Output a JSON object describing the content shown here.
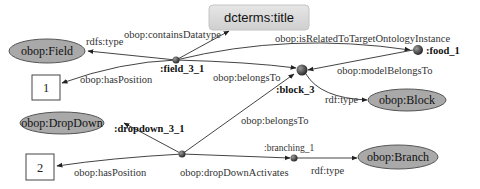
{
  "diagram": {
    "colors": {
      "class_fill": "#a9a9a9",
      "class_stroke": "#555555",
      "property_box_fill": "#d9d9d9",
      "instance_node": "#3a3a3a",
      "edge": "#444444"
    },
    "nodes": {
      "dcterms_title": "dcterms:title",
      "obop_field": "obop:Field",
      "obop_dropdown": "obop:DropDown",
      "obop_block": "obop:Block",
      "obop_branch": "obop:Branch",
      "literal_1": "1",
      "literal_2": "2",
      "field_3_1": ":field_3_1",
      "block_3": ":block_3",
      "food_1": ":food_1",
      "dropdown_3_1": ":dropdown_3_1",
      "branching_1": ":branching_1"
    },
    "edges": {
      "field_rdfs_type": "rdfs:type",
      "field_contains_datatype": "obop:containsDatatype",
      "field_has_position": "obop:hasPosition",
      "field_is_related": "obop:isRelatedToTargetOntologyInstance",
      "field_belongs_to": "obop:belongsTo",
      "food_model_belongs_to": "obop:modelBelongsTo",
      "block_rdf_type": "rdf:type",
      "dropdown_belongs_to": "obop:belongsTo",
      "dropdown_has_position": "obop:hasPosition",
      "dropdown_activates": "obop:dropDownActivates",
      "branching_rdf_type": "rdf:type"
    }
  }
}
